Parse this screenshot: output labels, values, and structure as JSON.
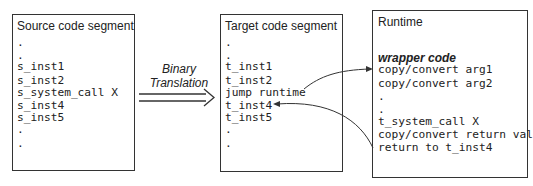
{
  "source": {
    "title": "Source code segment",
    "lines": [
      ".",
      ".",
      "s_inst1",
      "s_inst2",
      "s_system_call X",
      "s_inst4",
      "s_inst5",
      ".",
      "."
    ]
  },
  "translation": {
    "line1": "Binary",
    "line2": "Translation"
  },
  "target": {
    "title": "Target code segment",
    "lines": [
      ".",
      ".",
      "t_inst1",
      "t_inst2",
      "jump runtime",
      "t_inst4",
      "t_inst5",
      ".",
      "."
    ]
  },
  "runtime": {
    "title": "Runtime",
    "wrapper_label": "wrapper code",
    "lines": [
      "copy/convert arg1",
      "copy/convert arg2",
      ".",
      ".",
      "t_system_call X",
      "copy/convert return val",
      "return to t_inst4"
    ]
  }
}
